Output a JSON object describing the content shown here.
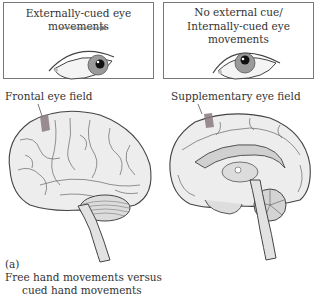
{
  "panels": [
    {
      "title_lines": [
        "Externally-cued eye movements"
      ],
      "cue_arrow": true,
      "gaze": "right"
    },
    {
      "title_lines": [
        "No external cue/",
        "Internally-cued eye movements"
      ],
      "cue_arrow": false,
      "gaze": "up"
    }
  ],
  "brains": [
    {
      "view": "lateral",
      "label": "Frontal eye field"
    },
    {
      "view": "medial",
      "label": "Supplementary eye field"
    }
  ],
  "caption": {
    "panel_letter": "(a)",
    "line1": "Free hand movements versus",
    "line2": "cued hand movements"
  },
  "colors": {
    "highlight": "#8a7a80",
    "line": "#555555",
    "shade": "#d8d8d8"
  }
}
